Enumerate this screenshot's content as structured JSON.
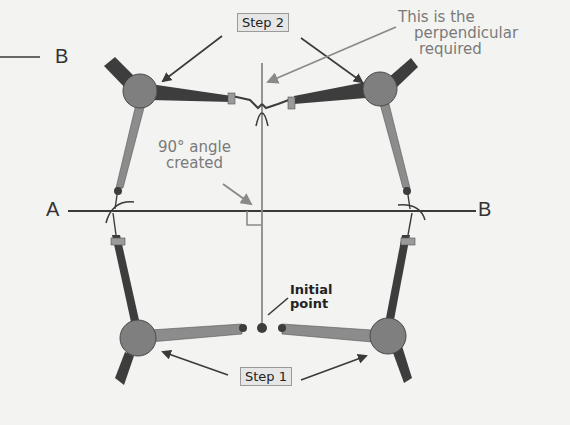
{
  "diagram": {
    "labels": {
      "step2": "Step 2",
      "step1": "Step 1",
      "perpendicular_line1": "This is the",
      "perpendicular_line2": "perpendicular",
      "perpendicular_line3": "required",
      "angle_line1": "90° angle",
      "angle_line2": "created",
      "initial_line1": "Initial",
      "initial_line2": "point",
      "point_a": "A",
      "point_b": "B",
      "top_stray_b": "B"
    },
    "colors": {
      "background": "#f3f3f1",
      "line": "#3a3a3a",
      "perpendicular": "#8a8a8a",
      "compass_hinge": "#7f7f7f",
      "compass_leg_dark": "#3d3d3d",
      "compass_leg_light": "#8c8c8c",
      "clamp": "#9a9a9a",
      "annotation_text": "#7a7a7a",
      "arrow_dark": "#3a3a3a",
      "arrow_grey": "#8a8a8a"
    }
  }
}
